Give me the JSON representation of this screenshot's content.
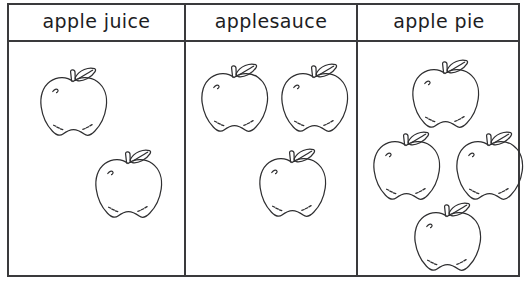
{
  "worksheet": {
    "title": "apple foods picture graph",
    "ink_color": "#3a3a3c",
    "text_color": "#1d1d1f",
    "background": "#ffffff"
  },
  "table": {
    "columns": [
      {
        "id": "apple-juice",
        "header": "apple juice",
        "apple_count": 2
      },
      {
        "id": "applesauce",
        "header": "applesauce",
        "apple_count": 3
      },
      {
        "id": "apple-pie",
        "header": "apple pie",
        "apple_count": 4
      }
    ]
  },
  "chart_data": {
    "type": "bar",
    "title": "",
    "xlabel": "",
    "ylabel": "",
    "categories": [
      "apple juice",
      "applesauce",
      "apple pie"
    ],
    "values": [
      2,
      3,
      4
    ],
    "ylim": [
      0,
      4
    ],
    "grid": false,
    "legend": null
  },
  "apples": {
    "icon": "apple-icon",
    "column_1": [
      {
        "x": 38,
        "y": 65
      },
      {
        "x": 93,
        "y": 147
      }
    ],
    "column_2": [
      {
        "x": 199,
        "y": 61
      },
      {
        "x": 279,
        "y": 61
      },
      {
        "x": 257,
        "y": 146
      }
    ],
    "column_3": [
      {
        "x": 410,
        "y": 57
      },
      {
        "x": 371,
        "y": 129
      },
      {
        "x": 454,
        "y": 129
      },
      {
        "x": 412,
        "y": 200
      }
    ]
  }
}
